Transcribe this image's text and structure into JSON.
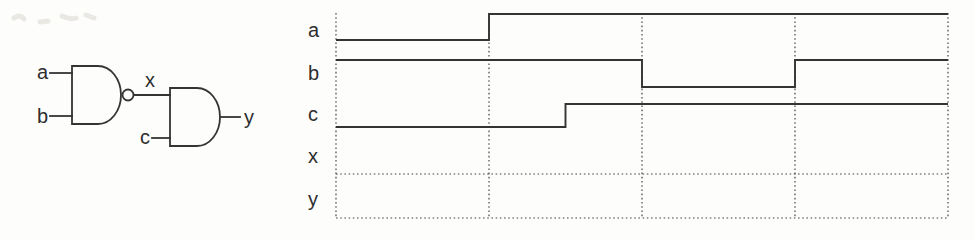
{
  "page": {
    "background": "#fdfdfc",
    "ink": "#343434"
  },
  "circuit": {
    "description": "Two-gate logic circuit: NAND(a,b) = x feeding AND(x,c) = y",
    "gates": [
      {
        "type": "NAND",
        "inputs": [
          "a",
          "b"
        ],
        "output": "x"
      },
      {
        "type": "AND",
        "inputs": [
          "x",
          "c"
        ],
        "output": "y"
      }
    ],
    "labels": {
      "a": "a",
      "b": "b",
      "c": "c",
      "x": "x",
      "y": "y"
    }
  },
  "timing": {
    "divisions": 4,
    "signals": [
      {
        "name": "a",
        "blank": false,
        "levels": [
          [
            0,
            1,
            0
          ],
          [
            1,
            4,
            1
          ]
        ]
      },
      {
        "name": "b",
        "blank": false,
        "levels": [
          [
            0,
            2,
            1
          ],
          [
            2,
            3,
            0
          ],
          [
            3,
            4,
            1
          ]
        ]
      },
      {
        "name": "c",
        "blank": false,
        "levels": [
          [
            0,
            1.5,
            0
          ],
          [
            1.5,
            4,
            1
          ]
        ]
      },
      {
        "name": "x",
        "blank": true,
        "levels": []
      },
      {
        "name": "y",
        "blank": true,
        "levels": []
      }
    ]
  }
}
